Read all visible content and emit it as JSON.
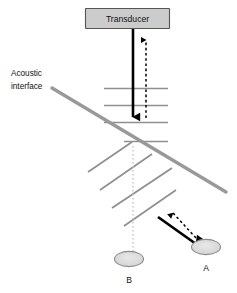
{
  "figure": {
    "type": "schematic-diagram",
    "background_color": "#ffffff"
  },
  "transducer": {
    "label": "Transducer",
    "fill_color": "#cccccc",
    "border_color": "#555555"
  },
  "interface": {
    "label_line1": "Acoustic",
    "label_line2": "interface",
    "color": "#999999"
  },
  "targets": [
    {
      "id": "A",
      "label": "A",
      "description": "apparent target position along refracted beam",
      "fill_color": "#dcdcdc",
      "stroke_color": "#8c8c8c"
    },
    {
      "id": "B",
      "label": "B",
      "description": "true target position along straight axis",
      "fill_color": "#dcdcdc",
      "stroke_color": "#8c8c8c"
    }
  ],
  "beams": {
    "transmit_solid": {
      "name": "incident beam",
      "style": "solid",
      "color": "#000000",
      "direction": "down"
    },
    "receive_dashed": {
      "name": "returning echo",
      "style": "dashed",
      "color": "#000000",
      "direction": "up"
    },
    "refracted_solid": {
      "name": "refracted beam",
      "style": "solid",
      "color": "#000000",
      "direction": "down-right"
    },
    "refracted_dashed": {
      "name": "refracted echo return",
      "style": "dashed",
      "color": "#000000",
      "direction": "up-left"
    }
  },
  "wavefronts": {
    "above_interface_color": "#8f8f8f",
    "below_interface_color": "#8f8f8f",
    "above_count": 4,
    "below_count": 3
  },
  "axis_line": {
    "name": "beam axis guide",
    "style": "dotted",
    "color": "#c3c3c3"
  }
}
